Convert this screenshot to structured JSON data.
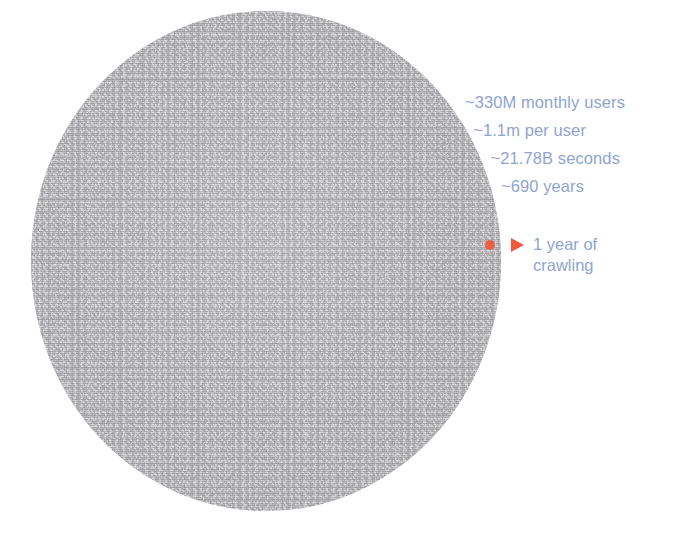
{
  "page": {
    "background_color": "#ffffff",
    "width": 676,
    "height": 533
  },
  "figure": {
    "name": "crawl-scale-comparison",
    "blob": {
      "label": "total-crawl-volume-circle",
      "fill_color": "#acacae",
      "texture": "grainy-noise"
    },
    "marker": {
      "dot_color": "#ef5a3c",
      "pointer_color": "#f05a3d",
      "pointer_glyph": "right-triangle"
    }
  },
  "stats": {
    "text_color": "#8fa4cf",
    "lines": [
      "~330M monthly users",
      "~1.1m per user",
      "~21.78B seconds",
      "~690 years"
    ]
  },
  "callout": {
    "text_color": "#8fa4cf",
    "lines": [
      "1 year of",
      "crawling"
    ]
  },
  "chart_data": {
    "type": "pie",
    "title": "",
    "xlabel": "",
    "ylabel": "",
    "annotations": [
      "~330M monthly users",
      "~1.1m per user",
      "~21.78B seconds",
      "~690 years",
      "1 year of crawling"
    ],
    "categories": [
      "~690 years of crawling",
      "1 year of crawling"
    ],
    "values": [
      689,
      1
    ],
    "units": "years",
    "legend": "none",
    "grid": false
  }
}
